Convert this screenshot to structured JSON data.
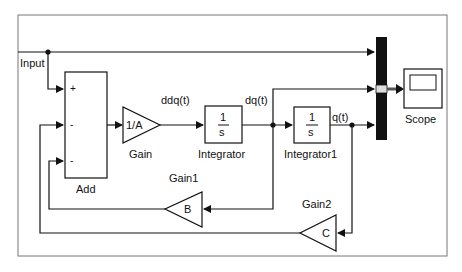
{
  "diagram": {
    "type": "simulink-block-diagram",
    "signals": {
      "input": "Input",
      "ddq": "ddq(t)",
      "dq": "dq(t)",
      "q": "q(t)"
    },
    "blocks": {
      "add": {
        "name": "Add",
        "ports": [
          "+",
          "-",
          "-"
        ]
      },
      "gain": {
        "name": "Gain",
        "value": "1/A"
      },
      "integrator": {
        "name": "Integrator",
        "num": "1",
        "den": "s"
      },
      "integrator1": {
        "name": "Integrator1",
        "num": "1",
        "den": "s"
      },
      "gain1": {
        "name": "Gain1",
        "value": "B"
      },
      "gain2": {
        "name": "Gain2",
        "value": "C"
      },
      "mux": {
        "name": "Mux"
      },
      "scope": {
        "name": "Scope"
      }
    },
    "colors": {
      "line": "#1a1a1a",
      "frame": "#7a7a7a",
      "background": "#ffffff"
    }
  }
}
